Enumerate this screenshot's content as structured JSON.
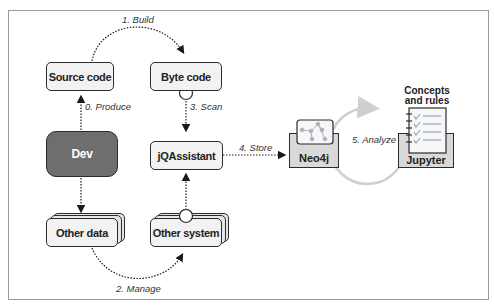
{
  "diagram": {
    "nodes": {
      "source_code": "Source code",
      "byte_code": "Byte code",
      "dev": "Dev",
      "jqassistant": "jQAssistant",
      "other_data": "Other data",
      "other_system": "Other system",
      "neo4j": "Neo4j",
      "jupyter": "Jupyter",
      "concepts_line1": "Concepts",
      "concepts_line2": "and rules"
    },
    "edges": {
      "produce": "0. Produce",
      "build": "1. Build",
      "manage": "2. Manage",
      "scan": "3. Scan",
      "store": "4. Store",
      "analyze": "5. Analyze"
    },
    "colors": {
      "dev_fill": "#6e6e6e",
      "node_fill": "#f2f2f2",
      "tray_fill": "#d9d9d9",
      "cycle_arrow": "#cfcfcf",
      "stroke": "#2b2b2b"
    }
  }
}
